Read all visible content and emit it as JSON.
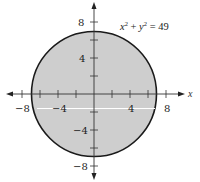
{
  "figure": {
    "equation": {
      "text_x": "x",
      "sup_x": "2",
      "plus": " + ",
      "text_y": "y",
      "sup_y": "2",
      "equals": " = ",
      "value": "49"
    },
    "axes": {
      "x_label": "x",
      "x_tick_labels": [
        {
          "value": -8,
          "label": "−8"
        },
        {
          "value": -4,
          "label": "−4"
        },
        {
          "value": 4,
          "label": "4"
        },
        {
          "value": 8,
          "label": "8"
        }
      ],
      "y_tick_labels": [
        {
          "value": 8,
          "label": "8"
        },
        {
          "value": 4,
          "label": "4"
        },
        {
          "value": -4,
          "label": "−4"
        },
        {
          "value": -8,
          "label": "−8"
        }
      ],
      "tick_step": 2,
      "range": [
        -8,
        8
      ]
    },
    "circle": {
      "radius": 7,
      "center": [
        0,
        0
      ],
      "fill": "#cfcfcf",
      "stroke": "#1a1a1a"
    },
    "colors": {
      "axis": "#333333",
      "background": "#ffffff"
    }
  }
}
